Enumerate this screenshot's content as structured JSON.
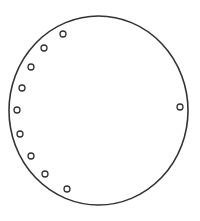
{
  "diagram": {
    "background": "#ffffff",
    "stroke_color": "#333333",
    "outer_circle": {
      "cx": 98.5,
      "cy": 110.5,
      "rx": 89.5,
      "ry": 94.5,
      "stroke_width": 1.6
    },
    "small_circle_radius": 3,
    "small_circle_stroke_width": 1.3,
    "small_circles": [
      {
        "cx": 63,
        "cy": 34
      },
      {
        "cx": 44,
        "cy": 48
      },
      {
        "cx": 31,
        "cy": 67
      },
      {
        "cx": 22,
        "cy": 88
      },
      {
        "cx": 17,
        "cy": 110
      },
      {
        "cx": 20,
        "cy": 134
      },
      {
        "cx": 31,
        "cy": 156
      },
      {
        "cx": 45,
        "cy": 174
      },
      {
        "cx": 67,
        "cy": 189
      },
      {
        "cx": 180,
        "cy": 107
      }
    ]
  }
}
